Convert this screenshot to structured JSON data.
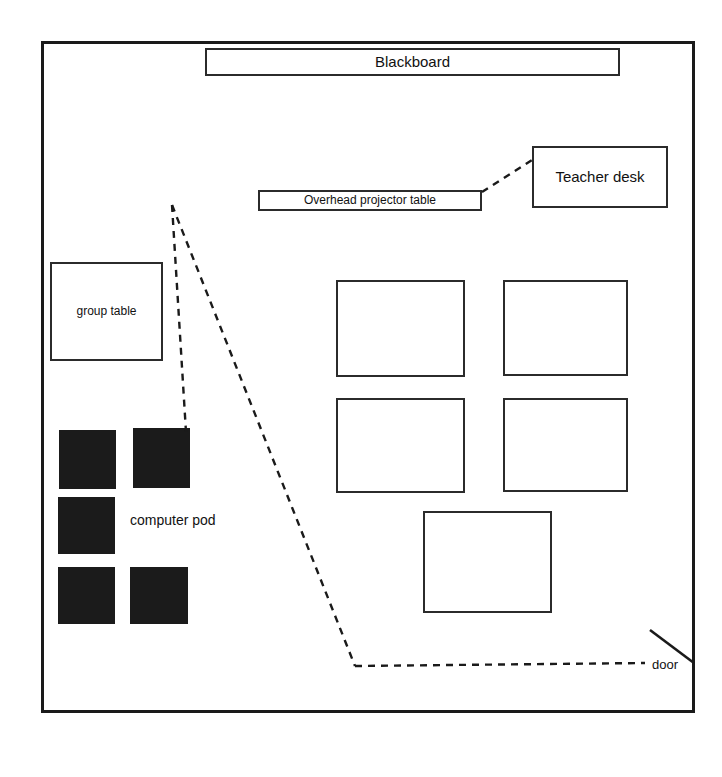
{
  "diagram": {
    "room": {
      "x": 41,
      "y": 41,
      "width": 654,
      "height": 672,
      "wall_color": "#1a1a1a"
    },
    "furniture": [
      {
        "id": "blackboard",
        "label": "Blackboard",
        "style": "outline",
        "x": 205,
        "y": 48,
        "width": 415,
        "height": 28
      },
      {
        "id": "teacher-desk",
        "label": "Teacher desk",
        "style": "outline",
        "x": 532,
        "y": 146,
        "width": 136,
        "height": 62
      },
      {
        "id": "projector-table",
        "label": "Overhead projector table",
        "style": "outline",
        "x": 258,
        "y": 190,
        "width": 224,
        "height": 21
      },
      {
        "id": "group-table",
        "label": "group table",
        "style": "outline",
        "x": 50,
        "y": 262,
        "width": 113,
        "height": 99
      }
    ],
    "student_desks": [
      {
        "id": "desk-1",
        "label": "",
        "x": 336,
        "y": 280,
        "width": 129,
        "height": 97
      },
      {
        "id": "desk-2",
        "label": "",
        "x": 503,
        "y": 280,
        "width": 125,
        "height": 96
      },
      {
        "id": "desk-3",
        "label": "",
        "x": 336,
        "y": 398,
        "width": 129,
        "height": 95
      },
      {
        "id": "desk-4",
        "label": "",
        "x": 503,
        "y": 398,
        "width": 125,
        "height": 94
      },
      {
        "id": "desk-5",
        "label": "",
        "x": 423,
        "y": 511,
        "width": 129,
        "height": 102
      }
    ],
    "computer_pod": {
      "label": "computer pod",
      "label_x": 130,
      "label_y": 512,
      "fill_color": "#1b1b1b",
      "stations": [
        {
          "id": "pod-1",
          "x": 59,
          "y": 430,
          "width": 57,
          "height": 59
        },
        {
          "id": "pod-2",
          "x": 133,
          "y": 428,
          "width": 57,
          "height": 60
        },
        {
          "id": "pod-3",
          "x": 58,
          "y": 497,
          "width": 57,
          "height": 57
        },
        {
          "id": "pod-4",
          "x": 58,
          "y": 567,
          "width": 57,
          "height": 57
        },
        {
          "id": "pod-5",
          "x": 130,
          "y": 567,
          "width": 58,
          "height": 57
        }
      ]
    },
    "door": {
      "label": "door",
      "label_x": 652,
      "label_y": 657,
      "swing_from_x": 694,
      "swing_from_y": 663,
      "swing_to_x": 650,
      "swing_to_y": 630
    },
    "dashed_paths": [
      {
        "id": "projector-to-teacher-desk",
        "points": "482,192 532,160"
      },
      {
        "id": "pod-branch",
        "points": "172,205 186,432"
      },
      {
        "id": "door-to-apex",
        "points": "172,205 355,666"
      },
      {
        "id": "door-floor-run",
        "points": "355,666 645,663"
      }
    ],
    "dash_style": {
      "color": "#1a1a1a",
      "width": 2.4,
      "dash_array": "7,6"
    }
  }
}
